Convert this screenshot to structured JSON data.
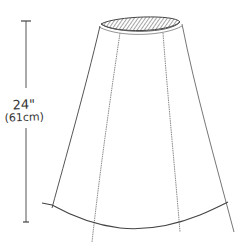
{
  "diagram": {
    "measurement": {
      "imperial": "24\"",
      "metric": "(61cm)"
    },
    "colors": {
      "line": "#555555",
      "hatch": "#777777",
      "background": "#ffffff"
    }
  }
}
